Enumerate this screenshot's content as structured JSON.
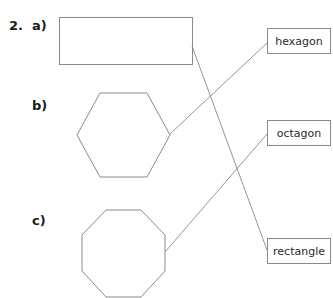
{
  "question": {
    "number": "2.",
    "parts": [
      {
        "label": "a)",
        "shape": "rectangle"
      },
      {
        "label": "b)",
        "shape": "hexagon"
      },
      {
        "label": "c)",
        "shape": "octagon"
      }
    ]
  },
  "answer_labels": [
    "hexagon",
    "octagon",
    "rectangle"
  ],
  "connections": [
    {
      "from": "a) rectangle shape",
      "to": "rectangle"
    },
    {
      "from": "b) hexagon shape",
      "to": "hexagon"
    },
    {
      "from": "c) octagon shape",
      "to": "octagon"
    }
  ],
  "colors": {
    "line": "#7a7a7a",
    "text": "#1a1a1a"
  }
}
